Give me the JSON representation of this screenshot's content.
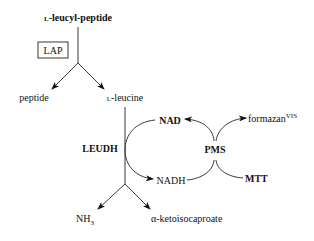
{
  "diagram": {
    "type": "biochemical-pathway",
    "nodes": {
      "substrate": {
        "prefix": "L",
        "text": "-leucyl-peptide"
      },
      "enzyme1": "LAP",
      "product1": "peptide",
      "product2": {
        "prefix": "L",
        "text": "-leucine"
      },
      "enzyme2": "LEUDH",
      "cofactor_ox": "NAD",
      "cofactor_red": "NADH",
      "mediator": "PMS",
      "dye_product": {
        "text": "formazan",
        "superscript": "VIS"
      },
      "dye_substrate": "MTT",
      "product3": {
        "text": "NH",
        "subscript": "3"
      },
      "product4": "α-ketoisocaproate"
    },
    "edges": [
      {
        "from": "L-leucyl-peptide",
        "to": "peptide",
        "via": "LAP"
      },
      {
        "from": "L-leucyl-peptide",
        "to": "L-leucine",
        "via": "LAP"
      },
      {
        "from": "L-leucine",
        "to": "NH3",
        "via": "LEUDH"
      },
      {
        "from": "L-leucine",
        "to": "α-ketoisocaproate",
        "via": "LEUDH"
      },
      {
        "from": "NAD",
        "to": "NADH",
        "via": "LEUDH"
      },
      {
        "from": "NADH",
        "to": "NAD",
        "via": "PMS"
      },
      {
        "from": "MTT",
        "to": "formazanVIS",
        "via": "PMS"
      }
    ]
  }
}
